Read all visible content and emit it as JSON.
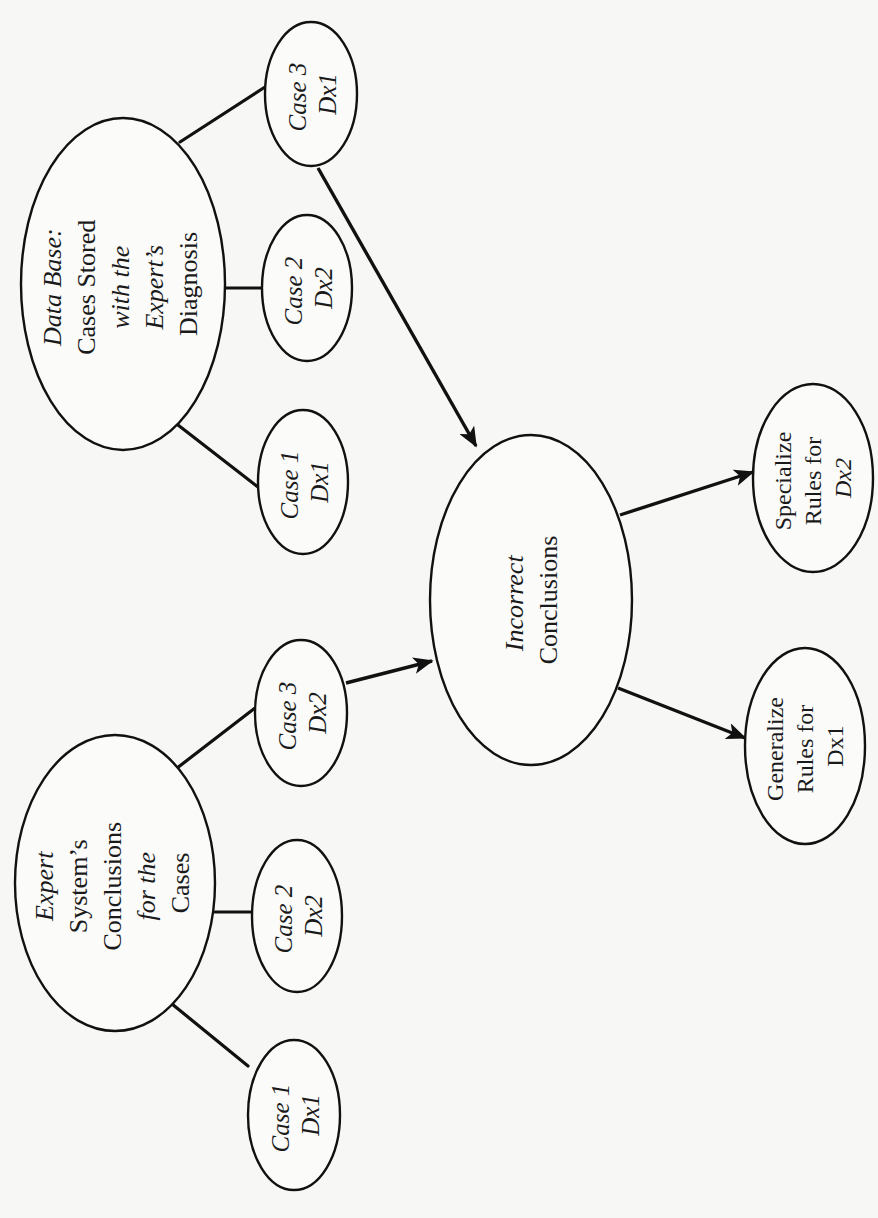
{
  "diagram": {
    "orientation": "rotated -90deg (reads bottom-to-top)",
    "colors": {
      "background": "#f7f7f5",
      "ink": "#111111"
    },
    "nodes": {
      "database": {
        "lines": [
          {
            "text": "Data Base:",
            "style": "it"
          },
          {
            "text": "Cases Stored",
            "style": "rm"
          },
          {
            "text": "with the",
            "style": "it"
          },
          {
            "text": "Expert’s",
            "style": "it"
          },
          {
            "text": "Diagnosis",
            "style": "rm"
          }
        ]
      },
      "db_case1": {
        "line1": "Case 1",
        "line2": "Dx1"
      },
      "db_case2": {
        "line1": "Case 2",
        "line2": "Dx2"
      },
      "db_case3": {
        "line1": "Case 3",
        "line2": "Dx1"
      },
      "expert": {
        "lines": [
          {
            "text": "Expert",
            "style": "it"
          },
          {
            "text": "System’s",
            "style": "rm"
          },
          {
            "text": "Conclusions",
            "style": "rm"
          },
          {
            "text": "for the",
            "style": "it"
          },
          {
            "text": "Cases",
            "style": "rm"
          }
        ]
      },
      "es_case1": {
        "line1": "Case 1",
        "line2": "Dx1"
      },
      "es_case2": {
        "line1": "Case 2",
        "line2": "Dx2"
      },
      "es_case3": {
        "line1": "Case 3",
        "line2": "Dx2"
      },
      "incorrect": {
        "lines": [
          {
            "text": "Incorrect",
            "style": "it"
          },
          {
            "text": "Conclusions",
            "style": "rm"
          }
        ]
      },
      "specialize": {
        "lines": [
          {
            "text": "Specialize",
            "style": "rm"
          },
          {
            "text": "Rules for",
            "style": "rm"
          },
          {
            "text": "Dx2",
            "style": "it"
          }
        ]
      },
      "generalize": {
        "lines": [
          {
            "text": "Generalize",
            "style": "rm"
          },
          {
            "text": "Rules for",
            "style": "rm"
          },
          {
            "text": "Dx1",
            "style": "rm"
          }
        ]
      }
    },
    "edges": [
      {
        "from": "database",
        "to": "db_case1",
        "type": "line"
      },
      {
        "from": "database",
        "to": "db_case2",
        "type": "line"
      },
      {
        "from": "database",
        "to": "db_case3",
        "type": "line"
      },
      {
        "from": "expert",
        "to": "es_case1",
        "type": "line"
      },
      {
        "from": "expert",
        "to": "es_case2",
        "type": "line"
      },
      {
        "from": "expert",
        "to": "es_case3",
        "type": "line"
      },
      {
        "from": "db_case3",
        "to": "incorrect",
        "type": "arrow"
      },
      {
        "from": "es_case3",
        "to": "incorrect",
        "type": "arrow"
      },
      {
        "from": "incorrect",
        "to": "specialize",
        "type": "arrow"
      },
      {
        "from": "incorrect",
        "to": "generalize",
        "type": "arrow"
      }
    ]
  }
}
